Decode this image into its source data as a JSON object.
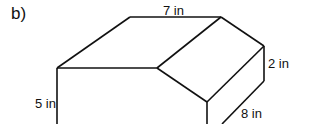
{
  "figure": {
    "part_label": "b)",
    "dimensions": {
      "top_length": "7 in",
      "right_height": "2 in",
      "left_height": "5 in",
      "depth": "8 in"
    },
    "stroke_color": "#111111"
  }
}
